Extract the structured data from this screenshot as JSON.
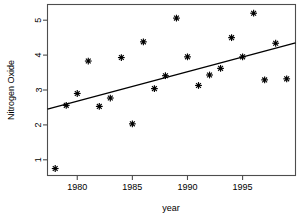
{
  "chart_data": {
    "type": "scatter",
    "title": "",
    "xlabel": "year",
    "ylabel": "Nitrogen Oxide",
    "xlim": [
      1977.3,
      1999.8
    ],
    "ylim": [
      0.55,
      5.45
    ],
    "grid": false,
    "legend": null,
    "marker": "asterisk",
    "x": [
      1978,
      1979,
      1980,
      1981,
      1982,
      1983,
      1984,
      1985,
      1986,
      1987,
      1988,
      1989,
      1990,
      1991,
      1992,
      1993,
      1994,
      1995,
      1996,
      1997,
      1998,
      1999
    ],
    "values": [
      0.75,
      2.56,
      2.9,
      3.83,
      2.53,
      2.77,
      3.93,
      2.03,
      4.38,
      3.04,
      3.41,
      5.06,
      3.95,
      3.13,
      3.43,
      3.62,
      4.5,
      3.95,
      5.2,
      3.29,
      4.34,
      3.32
    ],
    "xticks": [
      1980,
      1985,
      1990,
      1995
    ],
    "xtick_labels": [
      "1980",
      "1985",
      "1990",
      "1995"
    ],
    "yticks": [
      1,
      2,
      3,
      4,
      5
    ],
    "ytick_labels": [
      "1",
      "2",
      "3",
      "4",
      "5"
    ],
    "fit_line": {
      "type": "linear-regression",
      "x_start": 1977.3,
      "y_start": 2.45,
      "x_end": 1999.8,
      "y_end": 4.35
    },
    "colors": {
      "point": "#000000",
      "line": "#000000",
      "frame": "#4d4d4d",
      "background": "#ffffff"
    }
  }
}
